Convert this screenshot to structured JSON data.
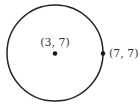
{
  "diagram": {
    "type": "circle",
    "center": {
      "label": "(3, 7)",
      "x": 3,
      "y": 7
    },
    "point_on_circle": {
      "label": "(7, 7)",
      "x": 7,
      "y": 7
    },
    "stroke_color": "#222222"
  }
}
